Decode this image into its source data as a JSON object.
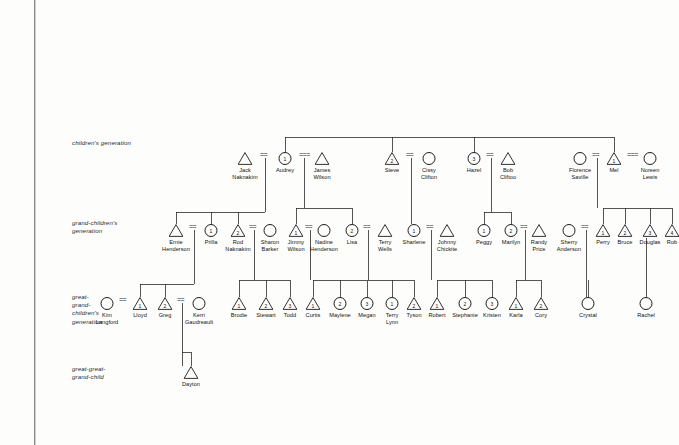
{
  "diagram": {
    "type": "genogram",
    "symbols": {
      "male": "triangle",
      "female": "circle",
      "union": "double-tick"
    },
    "generation_labels": [
      {
        "id": "children",
        "text": "children's generation",
        "x": 72,
        "y": 139
      },
      {
        "id": "grandchildren",
        "text": "grand-children's\ngeneration",
        "x": 72,
        "y": 219
      },
      {
        "id": "great-grandchildren",
        "text": "great-\ngrand-\nchildren's\ngeneration",
        "x": 72,
        "y": 293
      },
      {
        "id": "great-great-grandchild",
        "text": "great-great-\ngrand-child",
        "x": 72,
        "y": 365
      }
    ],
    "people": [
      {
        "id": "jack",
        "name": "Jack\nNaknakim",
        "shape": "triangle",
        "num": "",
        "x": 245,
        "y": 152
      },
      {
        "id": "audrey",
        "name": "Audrey",
        "shape": "circle",
        "num": "1",
        "x": 285,
        "y": 152
      },
      {
        "id": "james",
        "name": "James\nWilson",
        "shape": "triangle",
        "num": "",
        "x": 322,
        "y": 152
      },
      {
        "id": "steve",
        "name": "Steve",
        "shape": "triangle",
        "num": "2",
        "x": 392,
        "y": 152
      },
      {
        "id": "cissy",
        "name": "Cissy\nClifton",
        "shape": "circle",
        "num": "",
        "x": 429,
        "y": 152
      },
      {
        "id": "hazel",
        "name": "Hazel",
        "shape": "circle",
        "num": "3",
        "x": 474,
        "y": 152
      },
      {
        "id": "bobc",
        "name": "Bob\nCliftoo",
        "shape": "triangle",
        "num": "",
        "x": 508,
        "y": 152
      },
      {
        "id": "florence",
        "name": "Florence\nSaville",
        "shape": "circle",
        "num": "",
        "x": 580,
        "y": 152
      },
      {
        "id": "mel",
        "name": "Mel",
        "shape": "triangle",
        "num": "1",
        "x": 614,
        "y": 152
      },
      {
        "id": "noreen",
        "name": "Noreen\nLewis",
        "shape": "circle",
        "num": "",
        "x": 650,
        "y": 152
      },
      {
        "id": "ernie",
        "name": "Ernie\nHenderson",
        "shape": "triangle",
        "num": "",
        "x": 176,
        "y": 224
      },
      {
        "id": "prilla",
        "name": "Prilla",
        "shape": "circle",
        "num": "1",
        "x": 211,
        "y": 224
      },
      {
        "id": "rod",
        "name": "Rod\nNaknakim",
        "shape": "triangle",
        "num": "2",
        "x": 238,
        "y": 224
      },
      {
        "id": "sharon",
        "name": "Sharon\nBarker",
        "shape": "circle",
        "num": "",
        "x": 270,
        "y": 224
      },
      {
        "id": "jimmy",
        "name": "Jimmy\nWilson",
        "shape": "triangle",
        "num": "1",
        "x": 296,
        "y": 224
      },
      {
        "id": "nadine",
        "name": "Nadine\nHenderson",
        "shape": "circle",
        "num": "",
        "x": 324,
        "y": 224
      },
      {
        "id": "lisa",
        "name": "Lisa",
        "shape": "circle",
        "num": "2",
        "x": 352,
        "y": 224
      },
      {
        "id": "terryw",
        "name": "Terry\nWells",
        "shape": "triangle",
        "num": "",
        "x": 385,
        "y": 224
      },
      {
        "id": "sharlene",
        "name": "Sharlene",
        "shape": "circle",
        "num": "1",
        "x": 414,
        "y": 224
      },
      {
        "id": "johnny",
        "name": "Johnny\nChickite",
        "shape": "triangle",
        "num": "",
        "x": 447,
        "y": 224
      },
      {
        "id": "peggy",
        "name": "Peggy",
        "shape": "circle",
        "num": "1",
        "x": 484,
        "y": 224
      },
      {
        "id": "marilyn",
        "name": "Marilyn",
        "shape": "circle",
        "num": "2",
        "x": 511,
        "y": 224
      },
      {
        "id": "randy",
        "name": "Randy\nPrice",
        "shape": "triangle",
        "num": "",
        "x": 539,
        "y": 224
      },
      {
        "id": "sherry",
        "name": "Sherry\nAnderson",
        "shape": "circle",
        "num": "",
        "x": 569,
        "y": 224
      },
      {
        "id": "perry",
        "name": "Perry",
        "shape": "triangle",
        "num": "1",
        "x": 603,
        "y": 224
      },
      {
        "id": "bruce",
        "name": "Bruce",
        "shape": "triangle",
        "num": "2",
        "x": 625,
        "y": 224
      },
      {
        "id": "douglas",
        "name": "Douglas",
        "shape": "triangle",
        "num": "3",
        "x": 650,
        "y": 224
      },
      {
        "id": "rob",
        "name": "Rob",
        "shape": "triangle",
        "num": "4",
        "x": 672,
        "y": 224
      },
      {
        "id": "kim",
        "name": "Kim\nLangford",
        "shape": "circle",
        "num": "",
        "x": 107,
        "y": 297
      },
      {
        "id": "lloyd",
        "name": "Lloyd",
        "shape": "triangle",
        "num": "1",
        "x": 140,
        "y": 297
      },
      {
        "id": "greg",
        "name": "Greg",
        "shape": "triangle",
        "num": "2",
        "x": 165,
        "y": 297
      },
      {
        "id": "kerri",
        "name": "Kerri\nGaudreault",
        "shape": "circle",
        "num": "",
        "x": 199,
        "y": 297
      },
      {
        "id": "brodie",
        "name": "Brodie",
        "shape": "triangle",
        "num": "1",
        "x": 239,
        "y": 297
      },
      {
        "id": "stewart",
        "name": "Stewart",
        "shape": "triangle",
        "num": "2",
        "x": 266,
        "y": 297
      },
      {
        "id": "todd",
        "name": "Todd",
        "shape": "triangle",
        "num": "3",
        "x": 290,
        "y": 297
      },
      {
        "id": "curtis",
        "name": "Curtis",
        "shape": "triangle",
        "num": "1",
        "x": 313,
        "y": 297
      },
      {
        "id": "maylene",
        "name": "Maylene",
        "shape": "circle",
        "num": "2",
        "x": 340,
        "y": 297
      },
      {
        "id": "megan",
        "name": "Megan",
        "shape": "circle",
        "num": "3",
        "x": 367,
        "y": 297
      },
      {
        "id": "terryl",
        "name": "Terry\nLynn",
        "shape": "circle",
        "num": "1",
        "x": 392,
        "y": 297
      },
      {
        "id": "tyson",
        "name": "Tyson",
        "shape": "triangle",
        "num": "2",
        "x": 414,
        "y": 297
      },
      {
        "id": "robert",
        "name": "Robert",
        "shape": "triangle",
        "num": "1",
        "x": 437,
        "y": 297
      },
      {
        "id": "stephanie",
        "name": "Stephanie",
        "shape": "circle",
        "num": "2",
        "x": 465,
        "y": 297
      },
      {
        "id": "kristen",
        "name": "Kristen",
        "shape": "circle",
        "num": "3",
        "x": 492,
        "y": 297
      },
      {
        "id": "karla",
        "name": "Karla",
        "shape": "triangle",
        "num": "1",
        "x": 516,
        "y": 297
      },
      {
        "id": "cory",
        "name": "Cory",
        "shape": "triangle",
        "num": "2",
        "x": 541,
        "y": 297
      },
      {
        "id": "crystal",
        "name": "Crystal",
        "shape": "circle",
        "num": "",
        "x": 588,
        "y": 297
      },
      {
        "id": "rachel",
        "name": "Rachel",
        "shape": "circle",
        "num": "",
        "x": 646,
        "y": 297
      },
      {
        "id": "dayton",
        "name": "Dayton",
        "shape": "triangle",
        "num": "",
        "x": 191,
        "y": 366
      }
    ],
    "unions": [
      {
        "pair": [
          "jack",
          "audrey"
        ],
        "x": 265,
        "y": 155,
        "ticks": "=="
      },
      {
        "pair": [
          "audrey",
          "james"
        ],
        "x": 304,
        "y": 155,
        "ticks": "==="
      },
      {
        "pair": [
          "steve",
          "cissy"
        ],
        "x": 411,
        "y": 155,
        "ticks": "=="
      },
      {
        "pair": [
          "hazel",
          "bobc"
        ],
        "x": 491,
        "y": 155,
        "ticks": "=="
      },
      {
        "pair": [
          "florence",
          "mel"
        ],
        "x": 597,
        "y": 155,
        "ticks": "=="
      },
      {
        "pair": [
          "mel",
          "noreen"
        ],
        "x": 632,
        "y": 155,
        "ticks": "==="
      },
      {
        "pair": [
          "ernie",
          "prilla"
        ],
        "x": 194,
        "y": 227,
        "ticks": "=="
      },
      {
        "pair": [
          "rod",
          "sharon"
        ],
        "x": 254,
        "y": 227,
        "ticks": "=="
      },
      {
        "pair": [
          "jimmy",
          "nadine"
        ],
        "x": 310,
        "y": 227,
        "ticks": "=="
      },
      {
        "pair": [
          "lisa",
          "terryw"
        ],
        "x": 368,
        "y": 227,
        "ticks": "=="
      },
      {
        "pair": [
          "sharlene",
          "johnny"
        ],
        "x": 431,
        "y": 227,
        "ticks": "=="
      },
      {
        "pair": [
          "marilyn",
          "randy"
        ],
        "x": 525,
        "y": 227,
        "ticks": "=="
      },
      {
        "pair": [
          "sherry",
          "perry"
        ],
        "x": 586,
        "y": 227,
        "ticks": "=="
      },
      {
        "pair": [
          "kim",
          "lloyd"
        ],
        "x": 124,
        "y": 300,
        "ticks": "=="
      },
      {
        "pair": [
          "greg",
          "kerri"
        ],
        "x": 182,
        "y": 300,
        "ticks": "=="
      }
    ]
  }
}
